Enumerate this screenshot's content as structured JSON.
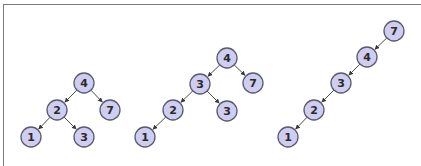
{
  "diagram": {
    "type": "binary-search-trees",
    "node_style": {
      "fill": "#cfcdf0",
      "stroke": "#5a5a6e",
      "radius": 10
    },
    "trees": [
      {
        "name": "balanced-tree",
        "nodes": [
          {
            "id": "t1n4",
            "label": "4",
            "x": 84,
            "y": 83
          },
          {
            "id": "t1n2",
            "label": "2",
            "x": 57,
            "y": 110
          },
          {
            "id": "t1n7",
            "label": "7",
            "x": 110,
            "y": 110
          },
          {
            "id": "t1n1",
            "label": "1",
            "x": 31,
            "y": 137
          },
          {
            "id": "t1n3",
            "label": "3",
            "x": 84,
            "y": 137
          }
        ],
        "edges": [
          [
            "t1n4",
            "t1n2"
          ],
          [
            "t1n4",
            "t1n7"
          ],
          [
            "t1n2",
            "t1n1"
          ],
          [
            "t1n2",
            "t1n3"
          ]
        ]
      },
      {
        "name": "unbalanced-tree",
        "nodes": [
          {
            "id": "t2n4",
            "label": "4",
            "x": 227,
            "y": 58
          },
          {
            "id": "t2n3a",
            "label": "3",
            "x": 200,
            "y": 84
          },
          {
            "id": "t2n7",
            "label": "7",
            "x": 253,
            "y": 83
          },
          {
            "id": "t2n2",
            "label": "2",
            "x": 173,
            "y": 110
          },
          {
            "id": "t2n3b",
            "label": "3",
            "x": 227,
            "y": 111
          },
          {
            "id": "t2n1",
            "label": "1",
            "x": 145,
            "y": 137
          }
        ],
        "edges": [
          [
            "t2n4",
            "t2n3a"
          ],
          [
            "t2n4",
            "t2n7"
          ],
          [
            "t2n3a",
            "t2n2"
          ],
          [
            "t2n3a",
            "t2n3b"
          ],
          [
            "t2n2",
            "t2n1"
          ]
        ]
      },
      {
        "name": "degenerate-tree",
        "nodes": [
          {
            "id": "t3n7",
            "label": "7",
            "x": 394,
            "y": 31
          },
          {
            "id": "t3n4",
            "label": "4",
            "x": 367,
            "y": 57
          },
          {
            "id": "t3n3",
            "label": "3",
            "x": 341,
            "y": 83
          },
          {
            "id": "t3n2",
            "label": "2",
            "x": 314,
            "y": 110
          },
          {
            "id": "t3n1",
            "label": "1",
            "x": 288,
            "y": 137
          }
        ],
        "edges": [
          [
            "t3n7",
            "t3n4"
          ],
          [
            "t3n4",
            "t3n3"
          ],
          [
            "t3n3",
            "t3n2"
          ],
          [
            "t3n2",
            "t3n1"
          ]
        ]
      }
    ]
  }
}
